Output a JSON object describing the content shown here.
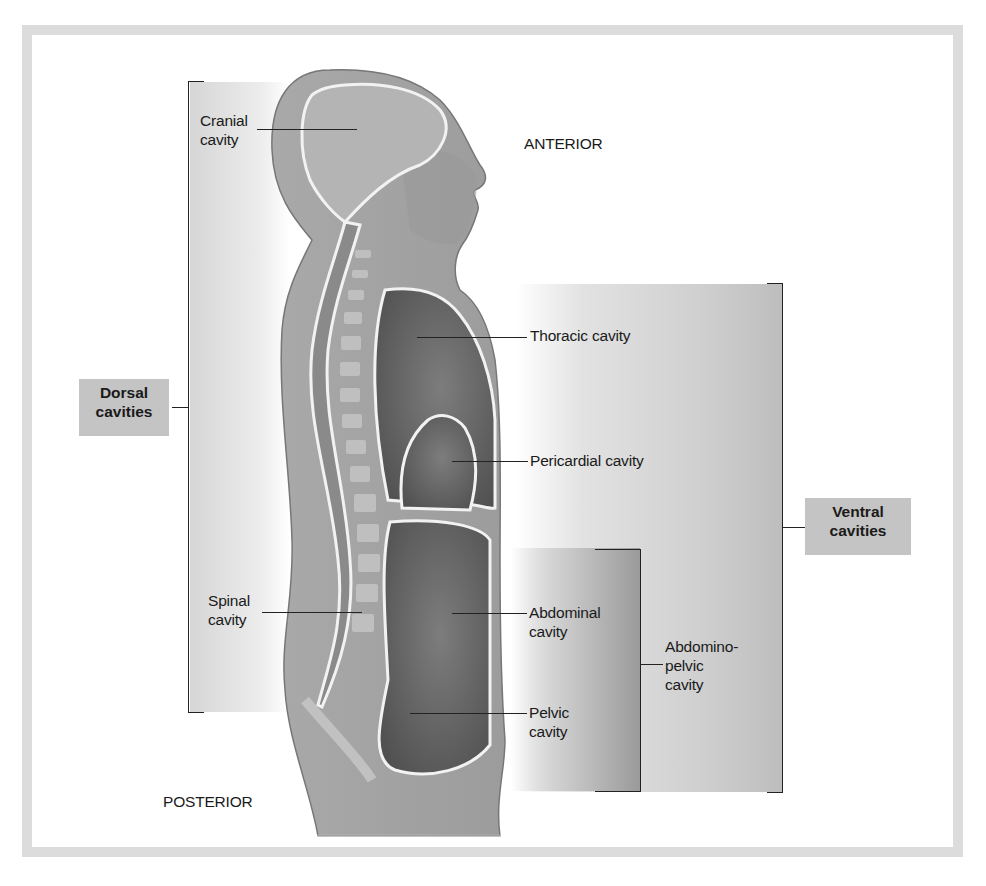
{
  "figure": {
    "orientation": {
      "anterior": "ANTERIOR",
      "posterior": "POSTERIOR"
    },
    "groups": {
      "dorsal": "Dorsal\ncavities",
      "ventral": "Ventral\ncavities",
      "abdominopelvic": "Abdomino-\npelvic\ncavity"
    },
    "cavities": {
      "cranial": "Cranial\ncavity",
      "spinal": "Spinal\ncavity",
      "thoracic": "Thoracic cavity",
      "pericardial": "Pericardial cavity",
      "abdominal": "Abdominal\ncavity",
      "pelvic": "Pelvic\ncavity"
    },
    "colors": {
      "frame": "#dcdcdc",
      "label_box": "#c4c4c4",
      "body": "#a8a8a8",
      "cavity": "#6e6e6e"
    }
  }
}
